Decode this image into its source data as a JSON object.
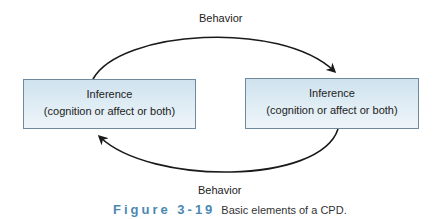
{
  "diagram": {
    "top_arrow_label": "Behavior",
    "bottom_arrow_label": "Behavior",
    "nodes": [
      {
        "title": "Inference",
        "subtitle": "(cognition or affect or both)"
      },
      {
        "title": "Inference",
        "subtitle": "(cognition or affect or both)"
      }
    ],
    "edges": [
      {
        "from": 0,
        "to": 1,
        "label": "Behavior",
        "path": "top"
      },
      {
        "from": 1,
        "to": 0,
        "label": "Behavior",
        "path": "bottom"
      }
    ],
    "colors": {
      "box_fill": "#dbe9f2",
      "box_border": "#6f8a9c",
      "arrow": "#1a1a1a",
      "figure_label": "#4a88b3"
    }
  },
  "caption": {
    "figure_label": "Figure 3-19",
    "text": "Basic elements of a CPD."
  }
}
